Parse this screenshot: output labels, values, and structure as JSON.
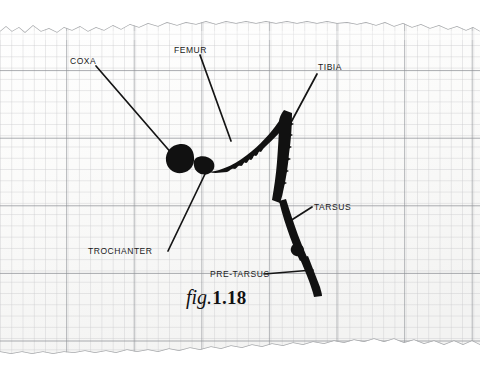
{
  "figure": {
    "caption_word": "fig.",
    "caption_number": "1.18",
    "medium": "torn-graph-paper-sheet",
    "paper_color": "#fbfbfb",
    "ink_color": "#111111",
    "grid_minor_color": "#c8c9cb",
    "grid_major_color": "#8d9095"
  },
  "labels": [
    {
      "id": "coxa",
      "text": "COXA",
      "x": 70,
      "y": 57
    },
    {
      "id": "femur",
      "text": "FEMUR",
      "x": 174,
      "y": 46
    },
    {
      "id": "tibia",
      "text": "TIBIA",
      "x": 318,
      "y": 63
    },
    {
      "id": "tarsus",
      "text": "TARSUS",
      "x": 314,
      "y": 203
    },
    {
      "id": "trochanter",
      "text": "TROCHANTER",
      "x": 88,
      "y": 247
    },
    {
      "id": "pre_tarsus",
      "text": "PRE-TARSUS",
      "x": 210,
      "y": 270
    }
  ],
  "leader_lines": [
    {
      "id": "coxa-leader",
      "x1": 96,
      "y1": 66,
      "x2": 173,
      "y2": 155
    },
    {
      "id": "femur-leader",
      "x1": 200,
      "y1": 55,
      "x2": 231,
      "y2": 141
    },
    {
      "id": "tibia-leader",
      "x1": 317,
      "y1": 74,
      "x2": 281,
      "y2": 141
    },
    {
      "id": "tarsus-leader",
      "x1": 312,
      "y1": 207,
      "x2": 290,
      "y2": 221
    },
    {
      "id": "trochanter-leader",
      "x1": 168,
      "y1": 251,
      "x2": 206,
      "y2": 172
    },
    {
      "id": "pre-tarsus-leader",
      "x1": 264,
      "y1": 274,
      "x2": 313,
      "y2": 270
    }
  ],
  "anatomy_segments": [
    {
      "id": "coxa-blob",
      "name": "coxa",
      "cx": 180,
      "cy": 158,
      "r": 14
    },
    {
      "id": "trochanter",
      "name": "trochanter",
      "cx": 205,
      "cy": 165,
      "r": 9
    },
    {
      "id": "femur",
      "name": "femur",
      "from_x": 212,
      "from_y": 166,
      "to_x": 283,
      "to_y": 112
    },
    {
      "id": "tibia",
      "name": "tibia",
      "from_x": 283,
      "from_y": 113,
      "to_x": 282,
      "to_y": 200
    },
    {
      "id": "tarsus",
      "name": "tarsus",
      "from_x": 282,
      "from_y": 200,
      "to_x": 305,
      "to_y": 262
    },
    {
      "id": "pre-tarsus",
      "name": "pre-tarsus",
      "from_x": 305,
      "from_y": 262,
      "to_x": 320,
      "to_y": 296
    }
  ],
  "grid": {
    "minor_spacing": 11,
    "major_spacing": 67.5,
    "major_vertical_x": [
      33,
      100,
      168,
      236,
      304,
      371,
      439
    ],
    "major_horizontal_y": [
      70,
      137,
      205,
      274
    ]
  }
}
